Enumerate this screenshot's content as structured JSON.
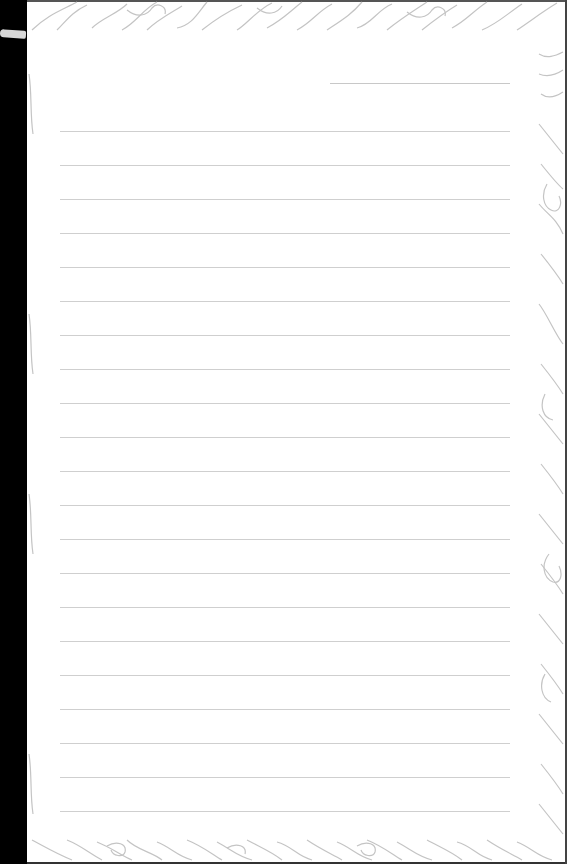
{
  "page": {
    "type": "lined-notebook-page",
    "border_style": "floral-line-art",
    "colors": {
      "paper": "#ffffff",
      "rule": "#cfcfcf",
      "floral": "#c4c4c4",
      "binding": "#000000"
    },
    "date_line": {
      "x1": 330,
      "x2": 510,
      "y": 83
    },
    "rules": {
      "count": 21,
      "x1": 60,
      "x2": 510,
      "start_y": 131,
      "spacing": 34
    }
  }
}
